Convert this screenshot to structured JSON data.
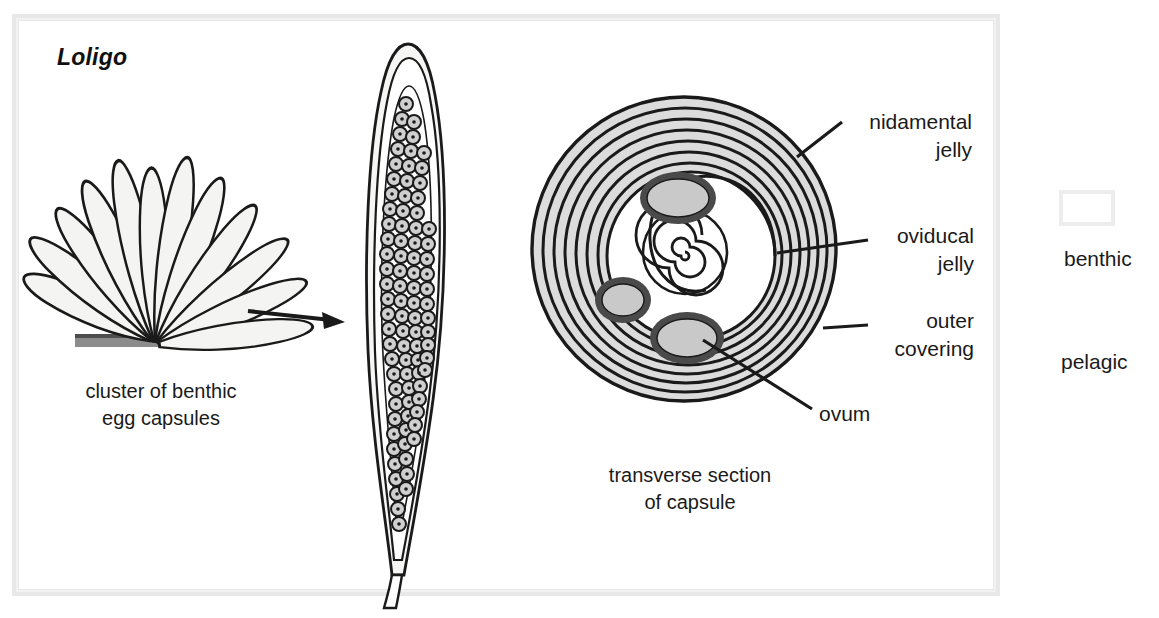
{
  "figure": {
    "genus_label": "Loligo",
    "captions": {
      "cluster": "cluster of benthic\negg capsules",
      "section": "transverse section\nof capsule"
    },
    "callouts": {
      "nidamental_jelly": "nidamental\njelly",
      "oviducal_jelly": "oviducal\njelly",
      "outer_covering": "outer\ncovering",
      "ovum": "ovum"
    },
    "legend": {
      "benthic": "benthic",
      "pelagic": "pelagic"
    },
    "colors": {
      "ink": "#1a1a1a",
      "jelly_fill": "#dcdcdc",
      "ovum_fill": "#c9c9c9",
      "substrate": "#8c8c8c",
      "capsule_fill": "#f4f4f2",
      "frame": "#e8e8e8",
      "background": "#ffffff"
    },
    "structures": {
      "cluster_capsule_count": 12,
      "section_ring_count": 9,
      "section_ovum_count": 4,
      "capsule_ovum_dot_rows": 30
    }
  }
}
